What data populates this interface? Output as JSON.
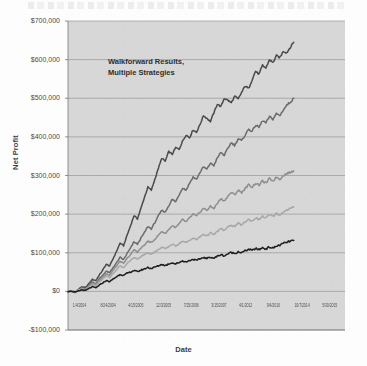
{
  "chart_data": {
    "type": "line",
    "title": "",
    "annotation": [
      "Walkforward Results,",
      "Multiple Strategies"
    ],
    "xlabel": "Date",
    "ylabel": "Net Profit",
    "ylim": [
      -100000,
      700000
    ],
    "ytick_labels": [
      "$700,000",
      "$600,000",
      "$500,000",
      "$400,000",
      "$300,000",
      "$200,000",
      "$100,000",
      "$0",
      "-$100,000"
    ],
    "ytick_values": [
      700000,
      600000,
      500000,
      400000,
      300000,
      200000,
      100000,
      0,
      -100000
    ],
    "xtick_labels": [
      "1/4/2004",
      "8/24/2004",
      "4/15/2005",
      "12/3/2005",
      "7/25/2006",
      "3/15/2007",
      "4/1/2012",
      "9/4/2010",
      "10/7/2014",
      "5/30/2015"
    ],
    "grid": true,
    "grid_color": "#8c8c8c",
    "plot_background": "#d7d7d7",
    "legend": "none",
    "x_start_label": "1/4/2004",
    "x_end_label": "5/30/2015",
    "series": [
      {
        "name": "Strategy 1 (steepest)",
        "color": "#4a4a4a",
        "final_value": 645000,
        "values": [
          0,
          2000,
          -3000,
          5000,
          12000,
          9000,
          20000,
          31000,
          28000,
          42000,
          55000,
          70000,
          66000,
          85000,
          104000,
          125000,
          118000,
          145000,
          170000,
          196000,
          188000,
          215000,
          243000,
          270000,
          262000,
          290000,
          318000,
          345000,
          337000,
          362000,
          355000,
          372000,
          368000,
          389000,
          405000,
          398000,
          418000,
          412000,
          432000,
          455000,
          448000,
          440000,
          462000,
          485000,
          478000,
          500000,
          495000,
          488000,
          505000,
          498000,
          515000,
          532000,
          525000,
          548000,
          570000,
          562000,
          585000,
          578000,
          600000,
          592000,
          610000,
          605000,
          622000,
          618000,
          632000,
          645000
        ]
      },
      {
        "name": "Strategy 2",
        "color": "#6b6b6b",
        "final_value": 500000,
        "values": [
          0,
          1000,
          -2000,
          4000,
          9000,
          6000,
          15000,
          24000,
          20000,
          32000,
          42000,
          52000,
          48000,
          62000,
          74000,
          88000,
          82000,
          98000,
          112000,
          128000,
          122000,
          138000,
          152000,
          168000,
          162000,
          178000,
          195000,
          210000,
          205000,
          222000,
          238000,
          232000,
          250000,
          268000,
          262000,
          280000,
          296000,
          290000,
          308000,
          322000,
          316000,
          332000,
          326000,
          345000,
          360000,
          352000,
          370000,
          385000,
          378000,
          395000,
          390000,
          405000,
          420000,
          414000,
          430000,
          425000,
          442000,
          436000,
          452000,
          446000,
          460000,
          455000,
          470000,
          482000,
          490000,
          500000
        ]
      },
      {
        "name": "Strategy 3",
        "color": "#8e8e8e",
        "final_value": 312000,
        "values": [
          0,
          1500,
          -1000,
          3000,
          8000,
          5000,
          13000,
          21000,
          18000,
          28000,
          37000,
          46000,
          42000,
          55000,
          66000,
          78000,
          72000,
          85000,
          95000,
          108000,
          102000,
          112000,
          120000,
          130000,
          126000,
          135000,
          145000,
          155000,
          150000,
          160000,
          170000,
          165000,
          175000,
          186000,
          180000,
          190000,
          200000,
          195000,
          205000,
          215000,
          210000,
          220000,
          215000,
          228000,
          240000,
          234000,
          246000,
          256000,
          250000,
          262000,
          256000,
          266000,
          276000,
          270000,
          280000,
          275000,
          286000,
          280000,
          292000,
          286000,
          296000,
          291000,
          300000,
          305000,
          308000,
          312000
        ]
      },
      {
        "name": "Strategy 4",
        "color": "#a8a8a8",
        "final_value": 218000,
        "values": [
          0,
          1000,
          -1500,
          2500,
          7000,
          4000,
          11000,
          18000,
          15000,
          24000,
          32000,
          40000,
          36000,
          47000,
          56000,
          66000,
          61000,
          72000,
          80000,
          88000,
          84000,
          90000,
          95000,
          100000,
          97000,
          102000,
          108000,
          114000,
          110000,
          116000,
          122000,
          118000,
          124000,
          130000,
          126000,
          132000,
          138000,
          134000,
          141000,
          148000,
          144000,
          151000,
          147000,
          155000,
          162000,
          158000,
          166000,
          172000,
          168000,
          176000,
          172000,
          180000,
          186000,
          182000,
          190000,
          186000,
          194000,
          190000,
          198000,
          194000,
          202000,
          198000,
          206000,
          210000,
          214000,
          218000
        ]
      },
      {
        "name": "Strategy 5 (lowest)",
        "color": "#1e1e1e",
        "final_value": 132000,
        "values": [
          0,
          500,
          -2500,
          1000,
          4000,
          2000,
          7000,
          12000,
          9000,
          16000,
          22000,
          28000,
          25000,
          32000,
          38000,
          44000,
          41000,
          47000,
          50000,
          54000,
          51000,
          55000,
          58000,
          62000,
          59000,
          63000,
          66000,
          70000,
          67000,
          71000,
          74000,
          71000,
          75000,
          79000,
          76000,
          80000,
          83000,
          80000,
          84000,
          88000,
          85000,
          89000,
          86000,
          91000,
          95000,
          92000,
          97000,
          101000,
          98000,
          103000,
          100000,
          105000,
          109000,
          106000,
          111000,
          108000,
          113000,
          110000,
          115000,
          112000,
          117000,
          120000,
          124000,
          127000,
          130000,
          132000
        ]
      }
    ]
  }
}
